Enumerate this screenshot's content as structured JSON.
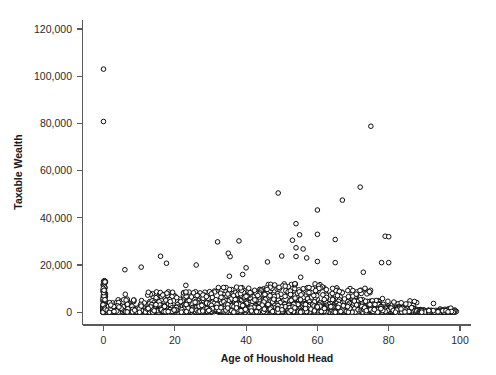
{
  "chart_data": {
    "type": "scatter",
    "title": "",
    "subtitle": "",
    "xlabel": "Age of Houshold Head",
    "ylabel": "Taxable Wealth",
    "xlim": [
      -3,
      104
    ],
    "ylim": [
      -4000,
      126000
    ],
    "xticks": [
      0,
      20,
      40,
      60,
      80,
      100
    ],
    "xtick_labels": [
      "0",
      "20",
      "40",
      "60",
      "80",
      "100"
    ],
    "yticks": [
      0,
      20000,
      40000,
      60000,
      80000,
      100000,
      120000
    ],
    "ytick_labels": [
      "0",
      "20,000",
      "40,000",
      "60,000",
      "80,000",
      "100,000",
      "120,000"
    ],
    "grid": false,
    "legend": null,
    "marker": "open-circle",
    "marker_color": "#0d0d0d",
    "marker_fill": "#ffffff",
    "marker_size": 4.6,
    "background": "#ffffff",
    "axis_color": "#5a5a5a",
    "n_points": 1860,
    "notable_outliers": [
      {
        "x": 0,
        "y": 103000
      },
      {
        "x": 0,
        "y": 80800
      },
      {
        "x": 75,
        "y": 78800
      },
      {
        "x": 72,
        "y": 53000
      },
      {
        "x": 49,
        "y": 50500
      },
      {
        "x": 67,
        "y": 47500
      },
      {
        "x": 60,
        "y": 43300
      },
      {
        "x": 54,
        "y": 37500
      },
      {
        "x": 79,
        "y": 32200
      },
      {
        "x": 80,
        "y": 32000
      },
      {
        "x": 60,
        "y": 33000
      },
      {
        "x": 55,
        "y": 32800
      },
      {
        "x": 53,
        "y": 30500
      },
      {
        "x": 65,
        "y": 30800
      },
      {
        "x": 32,
        "y": 29800
      },
      {
        "x": 38,
        "y": 30200
      },
      {
        "x": 56,
        "y": 26800
      },
      {
        "x": 54,
        "y": 27300
      },
      {
        "x": 35,
        "y": 25000
      },
      {
        "x": 16,
        "y": 23700
      },
      {
        "x": 50,
        "y": 23800
      },
      {
        "x": 54,
        "y": 23600
      },
      {
        "x": 57,
        "y": 23000
      },
      {
        "x": 78,
        "y": 21000
      },
      {
        "x": 80,
        "y": 21000
      },
      {
        "x": 60,
        "y": 21500
      },
      {
        "x": 65,
        "y": 21000
      },
      {
        "x": 6,
        "y": 18000
      },
      {
        "x": 26,
        "y": 20000
      },
      {
        "x": 46,
        "y": 21300
      },
      {
        "x": 40,
        "y": 18800
      }
    ]
  },
  "figure": {
    "x_axis_name": "x-axis",
    "y_axis_name": "y-axis"
  }
}
